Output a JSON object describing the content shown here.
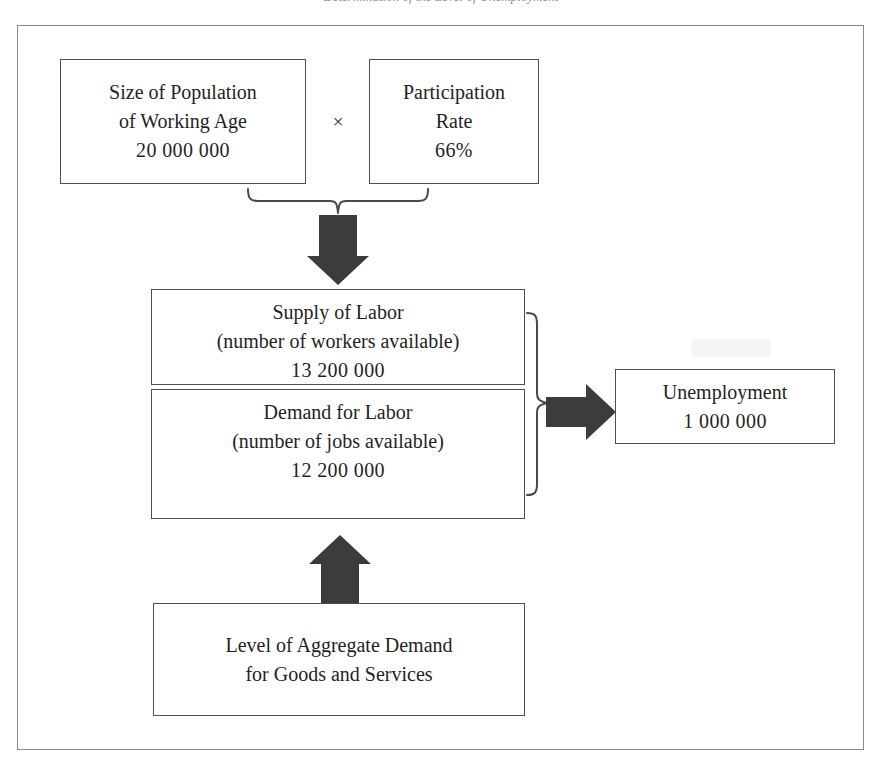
{
  "caption": {
    "text": "Determination of the Level of Unemployment"
  },
  "diagram": {
    "colors": {
      "arrow_fill": "#3c3c3c",
      "box_border": "#4f4f4f",
      "frame_border": "#8a8a8a",
      "text": "#1f1f1f",
      "background": "#ffffff"
    },
    "operators": {
      "multiply": "×"
    },
    "boxes": [
      {
        "id": "population",
        "lines": [
          "Size of Population",
          "of Working Age",
          "20 000 000"
        ],
        "line1": "Size of Population",
        "line2": "of Working Age",
        "line3": "20 000 000"
      },
      {
        "id": "participation",
        "lines": [
          "Participation",
          "Rate",
          "66%"
        ],
        "line1": "Participation",
        "line2": "Rate",
        "line3": "66%"
      },
      {
        "id": "supply",
        "lines": [
          "Supply of Labor",
          "(number of workers available)",
          "13 200 000"
        ],
        "line1": "Supply of Labor",
        "line2": "(number of workers available)",
        "line3": "13 200 000"
      },
      {
        "id": "demand",
        "lines": [
          "Demand for Labor",
          "(number of jobs available)",
          "12 200 000"
        ],
        "line1": "Demand for Labor",
        "line2": "(number of jobs available)",
        "line3": "12 200 000"
      },
      {
        "id": "unemployment",
        "lines": [
          "Unemployment",
          "1 000 000"
        ],
        "line1": "Unemployment",
        "line2": "1 000 000"
      },
      {
        "id": "aggregate_demand",
        "lines": [
          "Level of Aggregate Demand",
          "for Goods and Services"
        ],
        "line1": "Level of Aggregate Demand",
        "line2": "for Goods and Services"
      }
    ],
    "connectors": [
      {
        "id": "brace-top",
        "kind": "curly-brace",
        "orientation": "down",
        "from": [
          "population",
          "participation"
        ],
        "to": "supply"
      },
      {
        "id": "arrow-down",
        "kind": "block-arrow",
        "direction": "down",
        "to": "supply"
      },
      {
        "id": "brace-right",
        "kind": "curly-brace",
        "orientation": "right",
        "from": [
          "supply",
          "demand"
        ],
        "to": "unemployment"
      },
      {
        "id": "arrow-right",
        "kind": "block-arrow",
        "direction": "right",
        "to": "unemployment"
      },
      {
        "id": "arrow-up",
        "kind": "block-arrow",
        "direction": "up",
        "from": "aggregate_demand",
        "to": "demand"
      }
    ]
  }
}
